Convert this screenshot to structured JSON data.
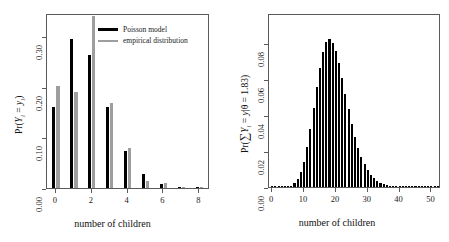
{
  "figure": {
    "background": "#ffffff",
    "width": 449,
    "height": 242
  },
  "colors": {
    "model": "#000000",
    "empirical": "#9e9e9e",
    "axis": "#5a5a5a",
    "text": "#111111"
  },
  "panels": {
    "left": {
      "xlabel": "number of children",
      "ylabel_prefix": "Pr(",
      "ylabel_Y": "Y",
      "ylabel_sub1": "i",
      "ylabel_eq": " = ",
      "ylabel_y": "y",
      "ylabel_sub2": "i",
      "ylabel_suffix": ")",
      "legend": {
        "model_label": "Poisson model",
        "empirical_label": "empirical distribution"
      }
    },
    "right": {
      "xlabel": "number of children",
      "ylabel_prefix": "Pr(",
      "ylabel_sum": "∑",
      "ylabel_Y": "Y",
      "ylabel_sub1": "i",
      "ylabel_eq": " = ",
      "ylabel_y": "y",
      "ylabel_bar": "|",
      "ylabel_theta": "θ",
      "ylabel_value": " = 1.83)"
    }
  },
  "chart_data": [
    {
      "type": "bar",
      "panel": "left",
      "title": "",
      "xlabel": "number of children",
      "ylabel": "Pr(Y_i = y_i)",
      "categories": [
        0,
        1,
        2,
        3,
        4,
        5,
        6,
        7,
        8
      ],
      "xticks": [
        0,
        2,
        4,
        6,
        8
      ],
      "yticks": [
        0.0,
        0.1,
        0.2,
        0.3
      ],
      "xlim": [
        -0.5,
        8.6
      ],
      "ylim": [
        0.0,
        0.345
      ],
      "grid": false,
      "legend_position": "top-right",
      "series": [
        {
          "name": "Poisson model",
          "color": "#000000",
          "values": [
            0.16,
            0.293,
            0.262,
            0.16,
            0.073,
            0.027,
            0.008,
            0.002,
            0.0006
          ]
        },
        {
          "name": "empirical distribution",
          "color": "#9e9e9e",
          "values": [
            0.201,
            0.19,
            0.34,
            0.168,
            0.078,
            0.014,
            0.01,
            0.0016,
            0.0016
          ]
        }
      ]
    },
    {
      "type": "bar",
      "panel": "right",
      "title": "",
      "xlabel": "number of children",
      "ylabel": "Pr(∑ Y_i = y|θ = 1.83)",
      "xticks": [
        0,
        10,
        20,
        30,
        40,
        50
      ],
      "yticks": [
        0.0,
        0.02,
        0.04,
        0.06,
        0.08
      ],
      "xlim": [
        -1,
        53
      ],
      "ylim": [
        0.0,
        0.097
      ],
      "grid": false,
      "theta": 1.83,
      "x": [
        0,
        1,
        2,
        3,
        4,
        5,
        6,
        7,
        8,
        9,
        10,
        11,
        12,
        13,
        14,
        15,
        16,
        17,
        18,
        19,
        20,
        21,
        22,
        23,
        24,
        25,
        26,
        27,
        28,
        29,
        30,
        31,
        32,
        33,
        34,
        35,
        36,
        37,
        38,
        39,
        40,
        41,
        42,
        43,
        44,
        45,
        46,
        47,
        48,
        49,
        50,
        51,
        52
      ],
      "values": [
        0.0,
        0.0,
        0.0,
        0.0,
        0.0001,
        0.0003,
        0.0008,
        0.002,
        0.0043,
        0.0082,
        0.0141,
        0.0222,
        0.0324,
        0.044,
        0.0558,
        0.0666,
        0.0752,
        0.0806,
        0.0823,
        0.0805,
        0.0758,
        0.0689,
        0.0606,
        0.0519,
        0.0433,
        0.0353,
        0.0281,
        0.0219,
        0.0168,
        0.0126,
        0.0093,
        0.0067,
        0.0048,
        0.0034,
        0.0023,
        0.0016,
        0.0011,
        0.0007,
        0.0005,
        0.0003,
        0.0002,
        0.0001,
        0.0001,
        0.0001,
        0.0,
        0.0,
        0.0,
        0.0,
        0.0,
        0.0,
        0.0,
        0.0,
        0.0
      ]
    }
  ]
}
